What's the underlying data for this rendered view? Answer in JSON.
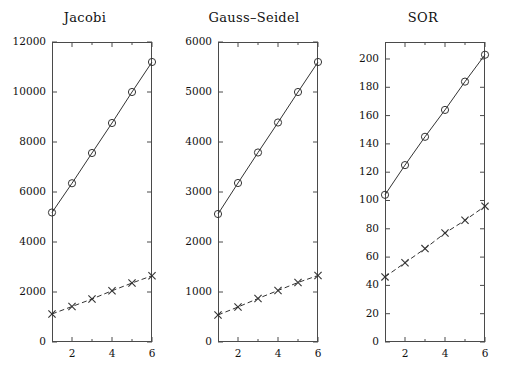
{
  "figure": {
    "background": "#ffffff",
    "axis_color": "#4a4a4a",
    "series_color": "#333333"
  },
  "panels": [
    {
      "title": "Jacobi",
      "x_ticks": [
        2,
        4,
        6
      ],
      "x_tick_labels": [
        "2",
        "4",
        "6"
      ],
      "x_minor_ticks": [
        1,
        3,
        5
      ],
      "xlim": [
        1,
        6
      ],
      "y_ticks": [
        0,
        2000,
        4000,
        6000,
        8000,
        10000,
        12000
      ],
      "y_tick_labels": [
        "0",
        "2000",
        "4000",
        "6000",
        "8000",
        "10000",
        "12000"
      ],
      "ylim": [
        0,
        12000
      ],
      "series": [
        {
          "name": "circle-series",
          "marker": "circle",
          "linestyle": "solid",
          "x": [
            1,
            2,
            3,
            4,
            5,
            6
          ],
          "values": [
            5180,
            6350,
            7560,
            8760,
            10000,
            11200
          ]
        },
        {
          "name": "cross-series",
          "marker": "cross",
          "linestyle": "dashed",
          "x": [
            1,
            2,
            3,
            4,
            5,
            6
          ],
          "values": [
            1120,
            1420,
            1720,
            2050,
            2360,
            2650
          ]
        }
      ]
    },
    {
      "title": "Gauss–Seidel",
      "x_ticks": [
        2,
        4,
        6
      ],
      "x_tick_labels": [
        "2",
        "4",
        "6"
      ],
      "x_minor_ticks": [
        1,
        3,
        5
      ],
      "xlim": [
        1,
        6
      ],
      "y_ticks": [
        0,
        1000,
        2000,
        3000,
        4000,
        5000,
        6000
      ],
      "y_tick_labels": [
        "0",
        "1000",
        "2000",
        "3000",
        "4000",
        "5000",
        "6000"
      ],
      "ylim": [
        0,
        6000
      ],
      "series": [
        {
          "name": "circle-series",
          "marker": "circle",
          "linestyle": "solid",
          "x": [
            1,
            2,
            3,
            4,
            5,
            6
          ],
          "values": [
            2560,
            3180,
            3790,
            4390,
            5000,
            5600
          ]
        },
        {
          "name": "cross-series",
          "marker": "cross",
          "linestyle": "dashed",
          "x": [
            1,
            2,
            3,
            4,
            5,
            6
          ],
          "values": [
            540,
            700,
            870,
            1030,
            1190,
            1330
          ]
        }
      ]
    },
    {
      "title": "SOR",
      "x_ticks": [
        2,
        4,
        6
      ],
      "x_tick_labels": [
        "2",
        "4",
        "6"
      ],
      "x_minor_ticks": [
        1,
        3,
        5
      ],
      "xlim": [
        1,
        6
      ],
      "y_ticks": [
        0,
        20,
        40,
        60,
        80,
        100,
        120,
        140,
        160,
        180,
        200
      ],
      "y_tick_labels": [
        "0",
        "20",
        "40",
        "60",
        "80",
        "100",
        "120",
        "140",
        "160",
        "180",
        "200"
      ],
      "ylim": [
        0,
        212
      ],
      "series": [
        {
          "name": "circle-series",
          "marker": "circle",
          "linestyle": "solid",
          "x": [
            1,
            2,
            3,
            4,
            5,
            6
          ],
          "values": [
            104,
            125,
            145,
            164,
            184,
            203
          ]
        },
        {
          "name": "cross-series",
          "marker": "cross",
          "linestyle": "dashed",
          "x": [
            1,
            2,
            3,
            4,
            5,
            6
          ],
          "values": [
            46,
            56,
            66,
            77,
            86,
            96
          ]
        }
      ]
    }
  ],
  "chart_data": {
    "type": "line",
    "title": "",
    "subplots": [
      {
        "title": "Jacobi",
        "xlabel": "",
        "ylabel": "",
        "xlim": [
          1,
          6
        ],
        "ylim": [
          0,
          12000
        ],
        "grid": false,
        "legend": "none",
        "x": [
          1,
          2,
          3,
          4,
          5,
          6
        ],
        "xticks": [
          2,
          4,
          6
        ],
        "yticks": [
          0,
          2000,
          4000,
          6000,
          8000,
          10000,
          12000
        ],
        "series": [
          {
            "name": "circle-series",
            "marker": "o",
            "linestyle": "-",
            "values": [
              5180,
              6350,
              7560,
              8760,
              10000,
              11200
            ]
          },
          {
            "name": "cross-series",
            "marker": "x",
            "linestyle": "--",
            "values": [
              1120,
              1420,
              1720,
              2050,
              2360,
              2650
            ]
          }
        ]
      },
      {
        "title": "Gauss–Seidel",
        "xlabel": "",
        "ylabel": "",
        "xlim": [
          1,
          6
        ],
        "ylim": [
          0,
          6000
        ],
        "grid": false,
        "legend": "none",
        "x": [
          1,
          2,
          3,
          4,
          5,
          6
        ],
        "xticks": [
          2,
          4,
          6
        ],
        "yticks": [
          0,
          1000,
          2000,
          3000,
          4000,
          5000,
          6000
        ],
        "series": [
          {
            "name": "circle-series",
            "marker": "o",
            "linestyle": "-",
            "values": [
              2560,
              3180,
              3790,
              4390,
              5000,
              5600
            ]
          },
          {
            "name": "cross-series",
            "marker": "x",
            "linestyle": "--",
            "values": [
              540,
              700,
              870,
              1030,
              1190,
              1330
            ]
          }
        ]
      },
      {
        "title": "SOR",
        "xlabel": "",
        "ylabel": "",
        "xlim": [
          1,
          6
        ],
        "ylim": [
          0,
          212
        ],
        "grid": false,
        "legend": "none",
        "x": [
          1,
          2,
          3,
          4,
          5,
          6
        ],
        "xticks": [
          2,
          4,
          6
        ],
        "yticks": [
          0,
          20,
          40,
          60,
          80,
          100,
          120,
          140,
          160,
          180,
          200
        ],
        "series": [
          {
            "name": "circle-series",
            "marker": "o",
            "linestyle": "-",
            "values": [
              104,
              125,
              145,
              164,
              184,
              203
            ]
          },
          {
            "name": "cross-series",
            "marker": "x",
            "linestyle": "--",
            "values": [
              46,
              56,
              66,
              77,
              86,
              96
            ]
          }
        ]
      }
    ]
  }
}
